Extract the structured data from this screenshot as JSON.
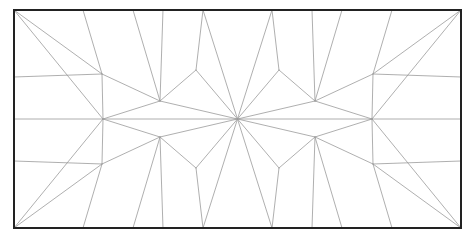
{
  "document": {
    "title": "Geometric Tessellation Diagram",
    "background_color": "#ffffff",
    "width": 475,
    "height": 239
  },
  "figure": {
    "name": "symmetric-polygon-tiling",
    "line_color": "#9a9a9a",
    "line_width": 0.8,
    "frame_color": "#222222",
    "frame_width": 2,
    "fill_color": "#ffffff"
  },
  "chart_data": {
    "type": "diagram",
    "frame": {
      "x0": 14,
      "y0": 10,
      "x1": 461,
      "y1": 228,
      "width": 447,
      "height": 218
    },
    "symmetry": {
      "vertical_axis_x": 237.5,
      "horizontal_axis_y": 119,
      "type": "bilateral-both-axes"
    },
    "hub": {
      "x": 237.5,
      "y": 119,
      "spoke_count": 12,
      "label": "central-hub"
    },
    "edge_vertices": {
      "top_y": 10,
      "bottom_y": 228,
      "left_x": 14,
      "right_x": 461,
      "top_x_positions": [
        14,
        83,
        133,
        163,
        203,
        272,
        312,
        342,
        392,
        461
      ],
      "bottom_x_positions": [
        14,
        83,
        133,
        163,
        203,
        272,
        312,
        342,
        392,
        461
      ],
      "left_y_positions": [
        10,
        77,
        119,
        161,
        228
      ],
      "right_y_positions": [
        10,
        77,
        119,
        161,
        228
      ]
    },
    "interior_vertices": [
      {
        "id": "A1",
        "x": 102,
        "y": 74
      },
      {
        "id": "A2",
        "x": 160,
        "y": 101
      },
      {
        "id": "A3",
        "x": 196,
        "y": 70
      },
      {
        "id": "A4",
        "x": 279,
        "y": 70
      },
      {
        "id": "A5",
        "x": 315,
        "y": 101
      },
      {
        "id": "A6",
        "x": 373,
        "y": 74
      },
      {
        "id": "B1",
        "x": 102,
        "y": 164
      },
      {
        "id": "B2",
        "x": 160,
        "y": 137
      },
      {
        "id": "B3",
        "x": 196,
        "y": 168
      },
      {
        "id": "B4",
        "x": 279,
        "y": 168
      },
      {
        "id": "B5",
        "x": 315,
        "y": 137
      },
      {
        "id": "B6",
        "x": 373,
        "y": 164
      },
      {
        "id": "M1",
        "x": 103,
        "y": 119
      },
      {
        "id": "M2",
        "x": 372,
        "y": 119
      }
    ],
    "segments": [
      {
        "name": "corner-fan-tl-1",
        "from": [
          14,
          10
        ],
        "to": [
          102,
          74
        ]
      },
      {
        "name": "corner-fan-tl-2",
        "from": [
          14,
          10
        ],
        "to": [
          83,
          10
        ]
      },
      {
        "name": "corner-fan-tl-3",
        "from": [
          14,
          10
        ],
        "to": [
          64,
          119
        ]
      },
      {
        "name": "corner-fan-bl-1",
        "from": [
          14,
          228
        ],
        "to": [
          102,
          164
        ]
      },
      {
        "name": "corner-fan-bl-2",
        "from": [
          14,
          228
        ],
        "to": [
          83,
          228
        ]
      },
      {
        "name": "corner-fan-bl-3",
        "from": [
          14,
          228
        ],
        "to": [
          64,
          119
        ]
      },
      {
        "name": "corner-fan-tr-1",
        "from": [
          461,
          10
        ],
        "to": [
          373,
          74
        ]
      },
      {
        "name": "corner-fan-tr-2",
        "from": [
          461,
          10
        ],
        "to": [
          392,
          10
        ]
      },
      {
        "name": "corner-fan-tr-3",
        "from": [
          461,
          10
        ],
        "to": [
          411,
          119
        ]
      },
      {
        "name": "corner-fan-br-1",
        "from": [
          461,
          228
        ],
        "to": [
          373,
          164
        ]
      },
      {
        "name": "corner-fan-br-2",
        "from": [
          461,
          228
        ],
        "to": [
          392,
          228
        ]
      },
      {
        "name": "corner-fan-br-3",
        "from": [
          461,
          228
        ],
        "to": [
          411,
          119
        ]
      },
      {
        "name": "midline-left",
        "from": [
          14,
          119
        ],
        "to": [
          237.5,
          119
        ]
      },
      {
        "name": "midline-right",
        "from": [
          237.5,
          119
        ],
        "to": [
          461,
          119
        ]
      },
      {
        "name": "spoke-1",
        "from": [
          237.5,
          119
        ],
        "to": [
          196,
          70
        ]
      },
      {
        "name": "spoke-2",
        "from": [
          237.5,
          119
        ],
        "to": [
          203,
          10
        ]
      },
      {
        "name": "spoke-3",
        "from": [
          237.5,
          119
        ],
        "to": [
          272,
          10
        ]
      },
      {
        "name": "spoke-4",
        "from": [
          237.5,
          119
        ],
        "to": [
          279,
          70
        ]
      },
      {
        "name": "spoke-5",
        "from": [
          237.5,
          119
        ],
        "to": [
          315,
          101
        ]
      },
      {
        "name": "spoke-6",
        "from": [
          237.5,
          119
        ],
        "to": [
          315,
          137
        ]
      },
      {
        "name": "spoke-7",
        "from": [
          237.5,
          119
        ],
        "to": [
          279,
          168
        ]
      },
      {
        "name": "spoke-8",
        "from": [
          237.5,
          119
        ],
        "to": [
          272,
          228
        ]
      },
      {
        "name": "spoke-9",
        "from": [
          237.5,
          119
        ],
        "to": [
          203,
          228
        ]
      },
      {
        "name": "spoke-10",
        "from": [
          237.5,
          119
        ],
        "to": [
          196,
          168
        ]
      },
      {
        "name": "spoke-11",
        "from": [
          237.5,
          119
        ],
        "to": [
          160,
          137
        ]
      },
      {
        "name": "spoke-12",
        "from": [
          237.5,
          119
        ],
        "to": [
          160,
          101
        ]
      }
    ],
    "polygon_counts": {
      "pentagons": 8,
      "hexagons": 2,
      "kites": 4,
      "triangles": 12
    },
    "xlabel": "",
    "ylabel": "",
    "grid": false,
    "legend": false
  }
}
